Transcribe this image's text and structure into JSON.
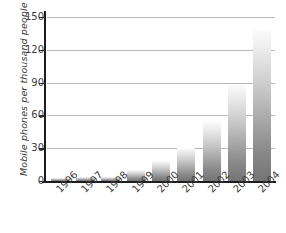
{
  "chart_data": {
    "type": "bar",
    "title": "",
    "subtitle": "",
    "xlabel": "",
    "ylabel": "Mobile phones per thousand people",
    "categories": [
      "1996",
      "1997",
      "1998",
      "1999",
      "2000",
      "2001",
      "2002",
      "2003",
      "2004"
    ],
    "values": [
      3,
      4,
      4,
      10,
      18,
      30,
      54,
      88,
      138
    ],
    "series": [
      {
        "name": "Mobile phones per thousand people",
        "values": [
          3,
          4,
          4,
          10,
          18,
          30,
          54,
          88,
          138
        ]
      }
    ],
    "ylim": [
      0,
      150
    ],
    "yticks": [
      0,
      30,
      60,
      90,
      120,
      150
    ],
    "ytick_labels": [
      "0",
      "30",
      "60",
      "90",
      "120",
      "150"
    ],
    "grid": true,
    "grid_axis": "y",
    "legend": false,
    "legend_position": "none",
    "annotations": [],
    "bar_style": {
      "fill": "vertical-gradient-grey",
      "gradient_top": "#fbfbfb",
      "gradient_bottom": "#747474"
    },
    "colors": {
      "axis": "#1c1c1c",
      "gridline": "#b9b9b9",
      "tick_text": "#3c3c3c",
      "axis_title": "#3a3a3a",
      "background": "#ffffff"
    },
    "xtick_rotation": -45
  }
}
